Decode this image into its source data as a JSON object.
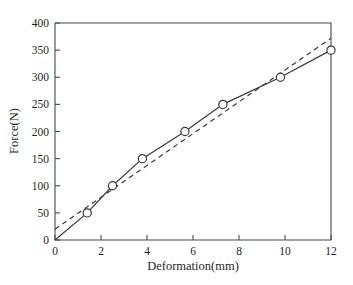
{
  "chart_data": {
    "type": "line",
    "title": "",
    "subtitle": "",
    "xlabel": "Deformation(mm)",
    "ylabel": "Force(N)",
    "xlim": [
      0,
      12
    ],
    "ylim": [
      0,
      400
    ],
    "xticks": [
      0,
      2,
      4,
      6,
      8,
      10,
      12
    ],
    "yticks": [
      0,
      50,
      100,
      150,
      200,
      250,
      300,
      350,
      400
    ],
    "xtick_labels": [
      "0",
      "2",
      "4",
      "6",
      "8",
      "10",
      "12"
    ],
    "ytick_labels": [
      "0",
      "50",
      "100",
      "150",
      "200",
      "250",
      "300",
      "350",
      "400"
    ],
    "grid": false,
    "legend": null,
    "legend_position": "none",
    "annotations": [],
    "series": [
      {
        "name": "measured-curve",
        "style": "solid",
        "marker": "open-circle",
        "points": [
          {
            "x": 0.0,
            "y": 0
          },
          {
            "x": 1.4,
            "y": 50
          },
          {
            "x": 2.5,
            "y": 100
          },
          {
            "x": 3.8,
            "y": 150
          },
          {
            "x": 5.65,
            "y": 200
          },
          {
            "x": 7.3,
            "y": 250
          },
          {
            "x": 9.8,
            "y": 300
          },
          {
            "x": 12.0,
            "y": 350
          }
        ],
        "marker_points": [
          {
            "x": 1.4,
            "y": 50
          },
          {
            "x": 2.5,
            "y": 100
          },
          {
            "x": 3.8,
            "y": 150
          },
          {
            "x": 5.65,
            "y": 200
          },
          {
            "x": 7.3,
            "y": 250
          },
          {
            "x": 9.8,
            "y": 300
          },
          {
            "x": 12.0,
            "y": 350
          }
        ]
      },
      {
        "name": "fitted-line",
        "style": "dashed",
        "marker": "none",
        "points": [
          {
            "x": 0.0,
            "y": 20
          },
          {
            "x": 12.0,
            "y": 372
          }
        ]
      }
    ],
    "colors": {
      "line": "#3a3a3a",
      "axis": "#4a4a4a",
      "background": "#ffffff",
      "marker_fill": "#ffffff"
    }
  }
}
